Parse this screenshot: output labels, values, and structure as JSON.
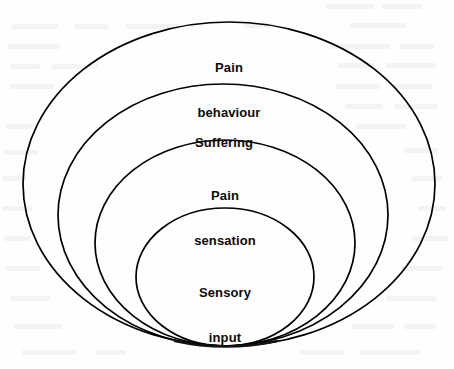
{
  "figure": {
    "type": "concentric-ellipse-diagram",
    "background_color": "#fefefe",
    "stroke_color": "#000000",
    "text_color": "#0b0b0b",
    "rings": [
      {
        "id": "pain-behaviour",
        "label": "Pain behaviour",
        "lines": [
          "Pain",
          "behaviour"
        ],
        "level": 1,
        "role": "outermost",
        "geometry": {
          "cx": 229,
          "cy": 184,
          "rx": 206,
          "ry": 162,
          "top": 22,
          "left": 23,
          "right": 435,
          "bottom": 346
        },
        "label_position": {
          "x": 229,
          "y": 30
        }
      },
      {
        "id": "suffering",
        "label": "Suffering",
        "lines": [
          "Suffering"
        ],
        "level": 2,
        "role": "middle-outer",
        "geometry": {
          "cx": 223,
          "cy": 215,
          "rx": 165,
          "ry": 131,
          "top": 84,
          "left": 58,
          "right": 388,
          "bottom": 346
        },
        "label_position": {
          "x": 224,
          "y": 105
        }
      },
      {
        "id": "pain-sensation",
        "label": "Pain sensation",
        "lines": [
          "Pain",
          "sensation"
        ],
        "level": 3,
        "role": "middle-inner",
        "geometry": {
          "cx": 225,
          "cy": 243,
          "rx": 130,
          "ry": 103,
          "top": 141,
          "left": 95,
          "right": 355,
          "bottom": 346
        },
        "label_position": {
          "x": 225,
          "y": 158
        }
      },
      {
        "id": "sensory-input",
        "label": "Sensory input",
        "lines": [
          "Sensory",
          "input"
        ],
        "level": 4,
        "role": "innermost",
        "geometry": {
          "cx": 225,
          "cy": 277,
          "rx": 89,
          "ry": 69,
          "top": 209,
          "left": 136,
          "right": 313,
          "bottom": 346
        },
        "label_position": {
          "x": 225,
          "y": 255
        }
      }
    ]
  }
}
